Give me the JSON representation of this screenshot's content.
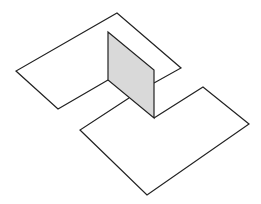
{
  "diagram": {
    "colors": {
      "background": "#ffffff",
      "stroke": "#222222",
      "plane_fill": "#d9d9d9"
    },
    "upper_plane": {
      "points": "117,13 181,68 154,83"
    },
    "upper_plane_left": {
      "points": "108,32 117,13"
    },
    "shapes": {
      "upper_half_plane": "108,32 117,13 181,68 154,83",
      "upper_half_plane_left": "108,80 58,109 16,71 117,13",
      "lower_half_plane": "129,98 80,130 147,195 249,124 203,87 154,118",
      "vertical_plane": "108,32 154,70 154,118 108,80"
    }
  }
}
